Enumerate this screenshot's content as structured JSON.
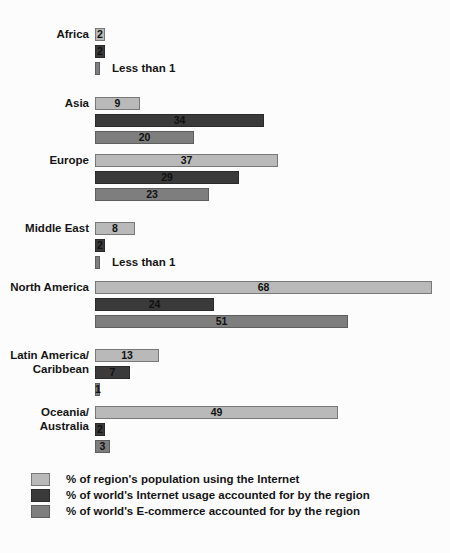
{
  "chart_data": {
    "type": "bar",
    "orientation": "horizontal",
    "title": "",
    "xlabel": "",
    "ylabel": "",
    "grid": false,
    "legend_position": "bottom-left",
    "xlim": [
      0,
      68
    ],
    "categories": [
      "Africa",
      "Asia",
      "Europe",
      "Middle East",
      "North America",
      "Latin America/\nCaribbean",
      "Oceania/\nAustralia"
    ],
    "series": [
      {
        "name": "% of region's population using the Internet",
        "color": "#b9b9b9",
        "values": [
          2,
          9,
          37,
          8,
          68,
          13,
          49
        ],
        "labels": [
          "2",
          "9",
          "37",
          "8",
          "68",
          "13",
          "49"
        ]
      },
      {
        "name": "% of world's Internet usage accounted for by the region",
        "color": "#3a3a3a",
        "values": [
          2,
          34,
          29,
          2,
          24,
          7,
          2
        ],
        "labels": [
          "2",
          "34",
          "29",
          "2",
          "24",
          "7",
          "2"
        ]
      },
      {
        "name": "% of world's E-commerce accounted for by the region",
        "color": "#7e7e7e",
        "values": [
          0.6,
          20,
          23,
          0.6,
          51,
          1,
          3
        ],
        "labels": [
          "Less than 1",
          "20",
          "23",
          "Less than 1",
          "51",
          "1",
          "3"
        ],
        "label_outside": [
          true,
          false,
          false,
          true,
          false,
          false,
          false
        ]
      }
    ],
    "annotations": [
      "Less than 1",
      "Less than 1"
    ]
  },
  "legend": {
    "items": [
      {
        "label": "% of region's population using the Internet",
        "color": "#b9b9b9"
      },
      {
        "label": "% of world's Internet usage accounted for by the region",
        "color": "#3a3a3a"
      },
      {
        "label": "% of world's E-commerce accounted for by the region",
        "color": "#7e7e7e"
      }
    ]
  }
}
